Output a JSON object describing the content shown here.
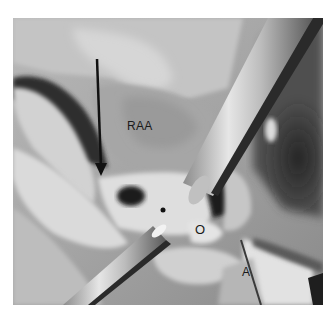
{
  "figure": {
    "type": "grayscale surgical photograph",
    "labels": {
      "raa": "RAA",
      "o": "O",
      "a": "A"
    },
    "annotations": [
      {
        "kind": "arrow",
        "direction": "down",
        "color": "#111111"
      }
    ],
    "colors": {
      "background": "#ffffff",
      "tissue_light": "#d8d8d8",
      "tissue_mid": "#a8a8a8",
      "shadow": "#2a2a2a",
      "instrument": "#c8c8c8"
    }
  }
}
